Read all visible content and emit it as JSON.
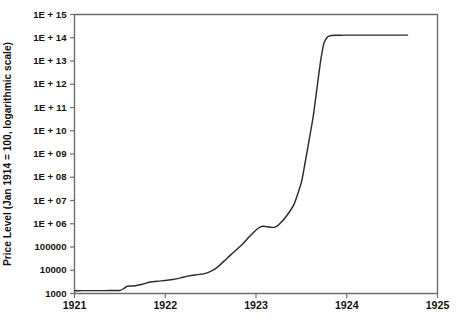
{
  "chart_data": {
    "type": "line",
    "title": "",
    "xlabel": "",
    "ylabel": "Price Level (Jan 1914 = 100, logarithmic scale)",
    "y_scale": "log",
    "ylim": [
      1000,
      1000000000000000
    ],
    "xlim": [
      1921,
      1925
    ],
    "grid": false,
    "legend": null,
    "y_tick_labels": [
      "1E + 15",
      "1E + 14",
      "1E + 13",
      "1E + 12",
      "1E + 11",
      "1E + 10",
      "1E + 09",
      "1E + 08",
      "1E + 07",
      "1E + 06",
      "100000",
      "10000",
      "1000"
    ],
    "y_tick_values": [
      1000000000000000.0,
      100000000000000.0,
      10000000000000.0,
      1000000000000.0,
      100000000000.0,
      10000000000.0,
      1000000000.0,
      100000000.0,
      10000000.0,
      1000000.0,
      100000.0,
      10000.0,
      1000.0
    ],
    "x_tick_labels": [
      "1921",
      "1922",
      "1923",
      "1924",
      "1925"
    ],
    "x_tick_values": [
      1921,
      1922,
      1923,
      1924,
      1925
    ],
    "series": [
      {
        "name": "German price level",
        "color": "#2b2b2b",
        "x": [
          1921.0,
          1921.08,
          1921.17,
          1921.25,
          1921.33,
          1921.42,
          1921.5,
          1921.54,
          1921.58,
          1921.63,
          1921.67,
          1921.75,
          1921.83,
          1921.92,
          1922.0,
          1922.08,
          1922.17,
          1922.25,
          1922.33,
          1922.42,
          1922.5,
          1922.58,
          1922.67,
          1922.75,
          1922.83,
          1922.92,
          1923.0,
          1923.04,
          1923.08,
          1923.13,
          1923.17,
          1923.21,
          1923.25,
          1923.33,
          1923.42,
          1923.5,
          1923.54,
          1923.58,
          1923.63,
          1923.67,
          1923.71,
          1923.75,
          1923.79,
          1923.83,
          1923.88,
          1923.92,
          1923.96,
          1924.0,
          1924.08,
          1924.17,
          1924.25,
          1924.33,
          1924.42,
          1924.5,
          1924.58,
          1924.67
        ],
        "y": [
          1320,
          1330,
          1330,
          1330,
          1330,
          1340,
          1350,
          1600,
          2050,
          2100,
          2150,
          2500,
          3100,
          3400,
          3600,
          4000,
          4700,
          5600,
          6300,
          7000,
          9000,
          14000,
          30000,
          58000,
          110000,
          260000,
          540000,
          700000,
          780000,
          740000,
          700000,
          720000,
          900000,
          2000000,
          7000000,
          60000000,
          400000000,
          3000000000,
          40000000000,
          600000000000,
          9000000000000,
          60000000000000,
          110000000000000,
          125000000000000,
          128000000000000,
          129000000000000,
          129500000000000,
          130000000000000,
          130000000000000,
          130000000000000,
          130000000000000,
          130000000000000,
          130000000000000,
          130000000000000,
          130000000000000,
          130000000000000
        ]
      }
    ]
  },
  "axes": {
    "y_axis_title": "Price Level (Jan 1914 = 100, logarithmic scale)"
  }
}
